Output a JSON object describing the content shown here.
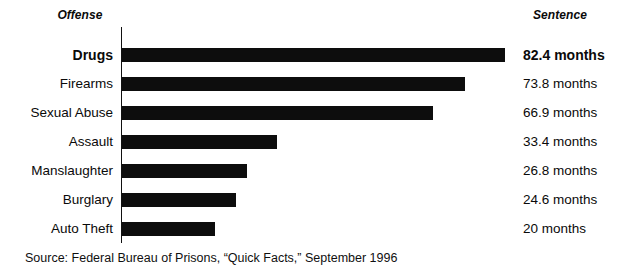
{
  "headers": {
    "offense": "Offense",
    "sentence": "Sentence"
  },
  "source": {
    "text": "Source: Federal Bureau of Prisons, “Quick Facts,” September 1996"
  },
  "style": {
    "bar_color": "#0d0d0d",
    "axis_color": "#111111",
    "background": "#ffffff",
    "text_color": "#0a0a0a"
  },
  "rows": [
    {
      "label": "Drugs",
      "value": 82.4,
      "value_label": "82.4 months",
      "emphasis": true
    },
    {
      "label": "Firearms",
      "value": 73.8,
      "value_label": "73.8 months",
      "emphasis": false
    },
    {
      "label": "Sexual Abuse",
      "value": 66.9,
      "value_label": "66.9 months",
      "emphasis": false
    },
    {
      "label": "Assault",
      "value": 33.4,
      "value_label": "33.4 months",
      "emphasis": false
    },
    {
      "label": "Manslaughter",
      "value": 26.8,
      "value_label": "26.8 months",
      "emphasis": false
    },
    {
      "label": "Burglary",
      "value": 24.6,
      "value_label": "24.6 months",
      "emphasis": false
    },
    {
      "label": "Auto Theft",
      "value": 20.0,
      "value_label": "20 months",
      "emphasis": false
    }
  ],
  "chart_data": {
    "type": "bar",
    "orientation": "horizontal",
    "title": "",
    "subtitle": "",
    "xlabel": "Sentence",
    "ylabel": "Offense",
    "categories": [
      "Drugs",
      "Firearms",
      "Sexual Abuse",
      "Assault",
      "Manslaughter",
      "Burglary",
      "Auto Theft"
    ],
    "values": [
      82.4,
      73.8,
      66.9,
      33.4,
      26.8,
      24.6,
      20
    ],
    "value_labels": [
      "82.4 months",
      "73.8 months",
      "66.9 months",
      "33.4 months",
      "26.8 months",
      "24.6 months",
      "20 months"
    ],
    "units": "months",
    "xlim": [
      0,
      82.4
    ],
    "grid": false,
    "legend": "none",
    "annotations": [
      "Source: Federal Bureau of Prisons, “Quick Facts,” September 1996"
    ],
    "highlighted_category": "Drugs"
  },
  "layout": {
    "axis_x_px": 121,
    "bar_origin_x_px": 122,
    "bar_max_px": 383,
    "row_pitch_px": 29,
    "first_row_top_px": 44
  }
}
